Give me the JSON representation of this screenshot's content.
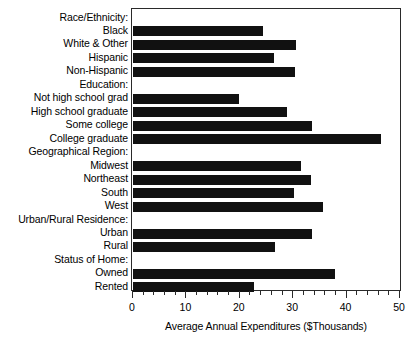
{
  "chart_data": {
    "type": "bar",
    "orientation": "horizontal",
    "title": "",
    "xlabel": "Average Annual Expenditures ($Thousands)",
    "ylabel": "",
    "xlim": [
      0,
      50
    ],
    "xticks": [
      0,
      10,
      20,
      30,
      40,
      50
    ],
    "xtick_labels": [
      "0",
      "10",
      "20",
      "30",
      "40",
      "50"
    ],
    "minor_tick_step": 2,
    "grid": false,
    "legend": null,
    "bar_color": "#111111",
    "frame_color": "#2a2a2a",
    "categories": [
      "Race/Ethnicity:",
      "Black",
      "White & Other",
      "Hispanic",
      "Non-Hispanic",
      "Education:",
      "Not high school grad",
      "High school graduate",
      "Some college",
      "College graduate",
      "Geographical Region:",
      "Midwest",
      "Northeast",
      "South",
      "West",
      "Urban/Rural Residence:",
      "Urban",
      "Rural",
      "Status of Home:",
      "Owned",
      "Rented"
    ],
    "values": [
      null,
      24.4,
      30.5,
      26.4,
      30.4,
      null,
      19.9,
      28.9,
      33.5,
      46.4,
      null,
      31.5,
      33.4,
      30.2,
      35.6,
      null,
      33.6,
      26.6,
      null,
      37.9,
      22.7
    ],
    "group_headers": [
      "Race/Ethnicity:",
      "Education:",
      "Geographical Region:",
      "Urban/Rural Residence:",
      "Status of Home:"
    ]
  }
}
